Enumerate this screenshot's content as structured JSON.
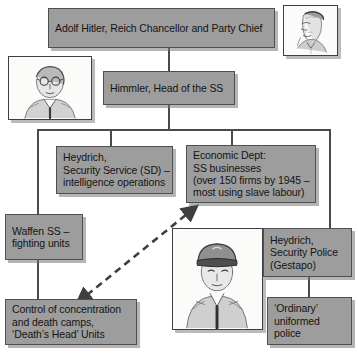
{
  "diagram": {
    "theme": {
      "box_fill": "#9d9d9d",
      "box_border": "#4f4f4f",
      "line_color": "#4a4a4a",
      "text_color": "#141414",
      "page_background": "#ffffff",
      "portrait_background": "#fbfbfa"
    },
    "nodes": {
      "hitler": {
        "label": "Adolf Hitler, Reich Chancellor and Party Chief"
      },
      "himmler": {
        "label": "Himmler, Head of the SS"
      },
      "heydrich_sd": {
        "line1": "Heydrich,",
        "line2": "Security Service (SD) –",
        "line3": "intelligence operations"
      },
      "economic_dept": {
        "line1": "Economic Dept:",
        "line2": "SS businesses",
        "line3": "(over 150 firms by 1945 –",
        "line4": "most using slave labour)"
      },
      "waffen_ss": {
        "line1": "Waffen SS –",
        "line2": "fighting units"
      },
      "camps": {
        "line1": "Control of concentration",
        "line2": "and death camps,",
        "line3": "‘Death’s Head’ Units"
      },
      "gestapo": {
        "line1": "Heydrich,",
        "line2": "Security Police",
        "line3": "(Gestapo)"
      },
      "ordinary_police": {
        "line1": "‘Ordinary’",
        "line2": "uniformed",
        "line3": "police"
      }
    },
    "portraits": {
      "hitler_portrait": {
        "name": "hitler-portrait"
      },
      "himmler_portrait": {
        "name": "himmler-portrait"
      },
      "officer_portrait": {
        "name": "ss-officer-portrait"
      }
    },
    "connectors": {
      "dashed_arrow": {
        "name": "bidirectional-dashed-arrow",
        "style": "dashed",
        "heads": "both"
      }
    }
  }
}
